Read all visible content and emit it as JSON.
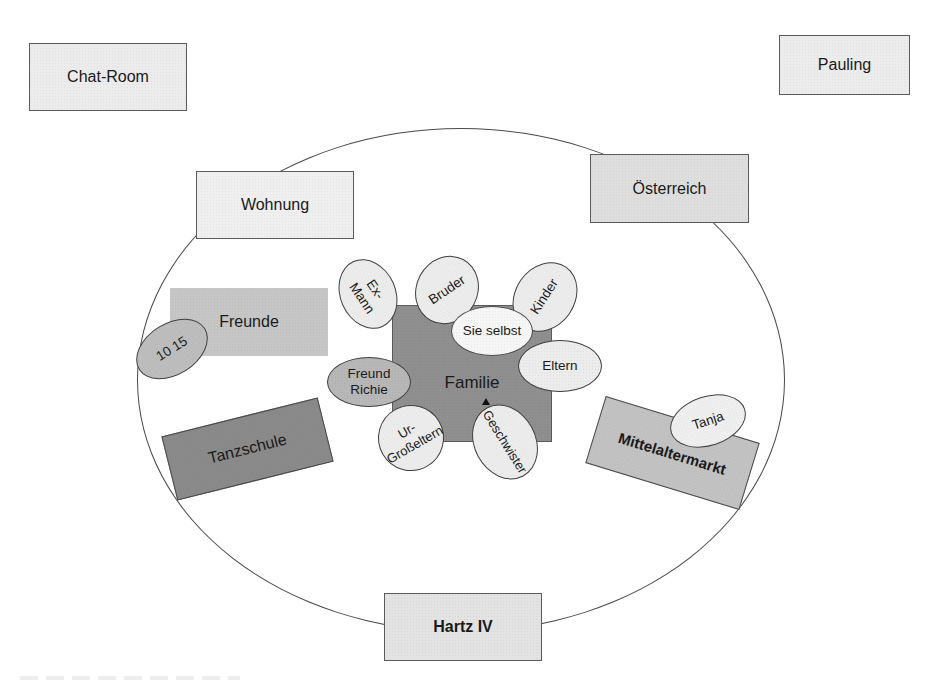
{
  "diagram": {
    "type": "network-map",
    "center": {
      "label": "Familie",
      "color": "#8f8f8f",
      "members": [
        {
          "id": "ex-mann",
          "label": "Ex-Mann"
        },
        {
          "id": "bruder",
          "label": "Bruder"
        },
        {
          "id": "kinder",
          "label": "Kinder"
        },
        {
          "id": "sie-selbst",
          "label": "Sie selbst"
        },
        {
          "id": "eltern",
          "label": "Eltern"
        },
        {
          "id": "freund-richie",
          "label": "Freund Richie",
          "line1": "Freund",
          "line2": "Richie"
        },
        {
          "id": "ur-grosseltern",
          "label": "Ur-Großeltern",
          "line1": "Ur-",
          "line2": "Großeltern"
        },
        {
          "id": "geschwister",
          "label": "Geschwister"
        }
      ]
    },
    "inner_nodes": [
      {
        "id": "wohnung",
        "label": "Wohnung",
        "color": "#ececec"
      },
      {
        "id": "oesterreich",
        "label": "Österreich",
        "color": "#d9d9d9"
      },
      {
        "id": "freunde",
        "label": "Freunde",
        "color": "#c6c6c6",
        "attached": {
          "label": "10 15"
        }
      },
      {
        "id": "tanzschule",
        "label": "Tanzschule",
        "color": "#8a8a8a"
      },
      {
        "id": "mittelaltermarkt",
        "label": "Mittelaltermarkt",
        "color": "#c2c2c2",
        "attached": {
          "label": "Tanja"
        }
      },
      {
        "id": "hartz-iv",
        "label": "Hartz IV",
        "color": "#e3e3e3"
      }
    ],
    "outer_nodes": [
      {
        "id": "chat-room",
        "label": "Chat-Room",
        "color": "#ececec"
      },
      {
        "id": "pauling",
        "label": "Pauling",
        "color": "#ececec"
      }
    ]
  }
}
